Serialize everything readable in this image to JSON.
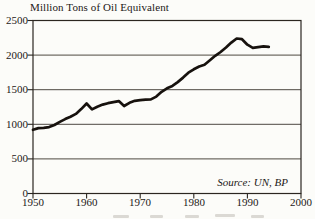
{
  "chart_data": {
    "type": "line",
    "title": "Million Tons of Oil Equivalent",
    "xlabel": "",
    "ylabel": "Million Tons of Oil Equivalent",
    "source_note": "Source: UN, BP",
    "xlim": [
      1950,
      2000
    ],
    "ylim": [
      0,
      2500
    ],
    "grid": "horizontal",
    "legend": "none",
    "line_color": "#17120e",
    "x_ticks": [
      1950,
      1960,
      1970,
      1980,
      1990,
      2000
    ],
    "y_ticks": [
      0,
      500,
      1000,
      1500,
      2000,
      2500
    ],
    "x_tick_labels": [
      "1950",
      "1960",
      "1970",
      "1980",
      "1990",
      "2000"
    ],
    "y_tick_labels": [
      "2500",
      "2000",
      "1500",
      "1000",
      "500",
      "0"
    ],
    "x": [
      1950,
      1951,
      1952,
      1953,
      1954,
      1955,
      1956,
      1957,
      1958,
      1959,
      1960,
      1961,
      1962,
      1963,
      1964,
      1965,
      1966,
      1967,
      1968,
      1969,
      1970,
      1971,
      1972,
      1973,
      1974,
      1975,
      1976,
      1977,
      1978,
      1979,
      1980,
      1981,
      1982,
      1983,
      1984,
      1985,
      1986,
      1987,
      1988,
      1989,
      1990,
      1991,
      1992,
      1993,
      1994
    ],
    "values": [
      920,
      945,
      950,
      960,
      990,
      1035,
      1075,
      1110,
      1150,
      1220,
      1300,
      1215,
      1255,
      1285,
      1305,
      1320,
      1335,
      1265,
      1310,
      1340,
      1350,
      1355,
      1360,
      1400,
      1470,
      1520,
      1555,
      1610,
      1675,
      1745,
      1795,
      1835,
      1860,
      1925,
      1990,
      2045,
      2110,
      2180,
      2240,
      2230,
      2150,
      2105,
      2115,
      2125,
      2120
    ]
  },
  "colors": {
    "paper": "#fcfcf9",
    "ink": "#1c1917",
    "grid": "#3a342c",
    "line": "#17120e"
  }
}
